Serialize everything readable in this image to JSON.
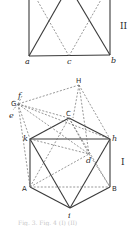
{
  "figure_II": {
    "roman_label": "II",
    "points": {
      "a": {
        "label": "a",
        "x": 29,
        "y": 56
      },
      "c": {
        "label": "c",
        "x": 69,
        "y": 56
      },
      "b": {
        "label": "b",
        "x": 110,
        "y": 55
      }
    }
  },
  "figure_I": {
    "roman_label": "I",
    "points": {
      "H": {
        "label": "H",
        "x": 79,
        "y": 85
      },
      "C": {
        "label": "C",
        "x": 69,
        "y": 110
      },
      "G": {
        "label": "G",
        "x": 18,
        "y": 100
      },
      "f": {
        "label": "f",
        "x": 19,
        "y": 93
      },
      "e": {
        "label": "e",
        "x": 14,
        "y": 107
      },
      "k": {
        "label": "k",
        "x": 30,
        "y": 139
      },
      "h": {
        "label": "h",
        "x": 110,
        "y": 139
      },
      "d": {
        "label": "d",
        "x": 89,
        "y": 156
      },
      "A": {
        "label": "A",
        "x": 30,
        "y": 187
      },
      "B": {
        "label": "B",
        "x": 110,
        "y": 187
      },
      "i": {
        "label": "i",
        "x": 70,
        "y": 210
      }
    }
  },
  "caption": "Fig. 3. Fig. 4 (I) (II)"
}
